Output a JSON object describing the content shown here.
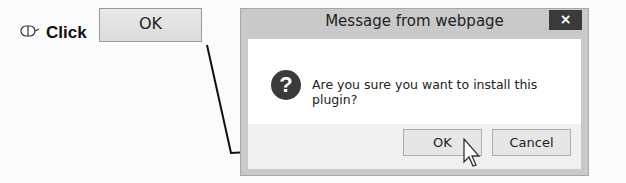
{
  "instruction": {
    "action_icon": "mouse-icon",
    "action_label": "Click",
    "target_button_label": "OK"
  },
  "dialog": {
    "title": "Message from webpage",
    "close_icon": "×",
    "icon": "question-icon",
    "icon_glyph": "?",
    "message": "Are you sure you want to install this plugin?",
    "buttons": {
      "ok": "OK",
      "cancel": "Cancel"
    }
  },
  "colors": {
    "close_button_bg": "#3a3a3a",
    "dialog_frame": "#c9c9c9",
    "connector_line": "#111111"
  }
}
